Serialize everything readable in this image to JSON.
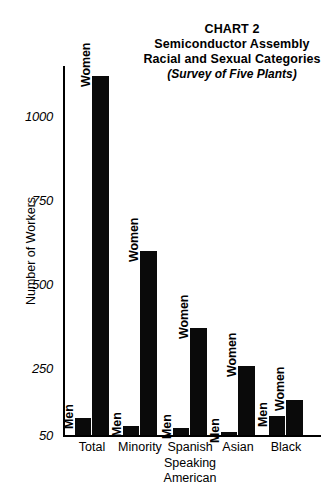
{
  "title": {
    "line1": "CHART 2",
    "line2": "Semiconductor Assembly",
    "line3": "Racial and Sexual Categories",
    "line4": "(Survey of Five Plants)"
  },
  "axis": {
    "y_title": "Number of Workers",
    "y_ticks": [
      "1000",
      "750",
      "500",
      "250",
      "50"
    ]
  },
  "chart_data": {
    "type": "bar",
    "title": "CHART 2 Semiconductor Assembly Racial and Sexual Categories (Survey of Five Plants)",
    "subtitle": "(Survey of Five Plants)",
    "xlabel": "",
    "ylabel": "Number of Workers",
    "ylim": [
      50,
      1150
    ],
    "yticks": [
      50,
      250,
      500,
      750,
      1000
    ],
    "grid": false,
    "legend": "none",
    "categories": [
      "Total",
      "Minority",
      "Spanish Speaking American",
      "Asian",
      "Black"
    ],
    "series": [
      {
        "name": "Men",
        "values": [
          100,
          78,
          72,
          58,
          108
        ]
      },
      {
        "name": "Women",
        "values": [
          1120,
          600,
          370,
          255,
          155
        ]
      }
    ],
    "bar_labels": {
      "men": "Men",
      "women": "Women"
    }
  },
  "categories": [
    {
      "id": "total",
      "lines": [
        "Total"
      ]
    },
    {
      "id": "minority",
      "lines": [
        "Minority"
      ]
    },
    {
      "id": "spanish",
      "lines": [
        "Spanish",
        "Speaking",
        "American"
      ]
    },
    {
      "id": "asian",
      "lines": [
        "Asian"
      ]
    },
    {
      "id": "black",
      "lines": [
        "Black"
      ]
    }
  ],
  "bars": {
    "total_men": "Men",
    "total_women": "Women",
    "minority_men": "Men",
    "minority_women": "Women",
    "spanish_men": "Men",
    "spanish_women": "Women",
    "asian_men": "Men",
    "asian_women": "Women",
    "black_men": "Men",
    "black_women": "Women"
  },
  "colors": {
    "bar": "#0a0a0a",
    "axis": "#000000",
    "background": "#ffffff"
  }
}
